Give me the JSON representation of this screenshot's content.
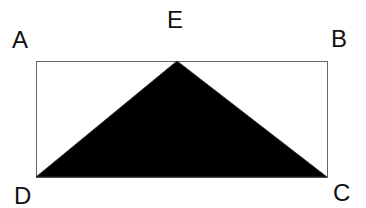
{
  "diagram": {
    "points": {
      "A": {
        "label": "A",
        "x": 36,
        "y": 61
      },
      "B": {
        "label": "B",
        "x": 327,
        "y": 61
      },
      "C": {
        "label": "C",
        "x": 327,
        "y": 177
      },
      "D": {
        "label": "D",
        "x": 36,
        "y": 177
      },
      "E": {
        "label": "E",
        "x": 177,
        "y": 61
      }
    },
    "shapes": [
      {
        "type": "rectangle",
        "vertices": [
          "A",
          "B",
          "C",
          "D"
        ],
        "fill": "#ffffff",
        "stroke": "#555555"
      },
      {
        "type": "triangle",
        "vertices": [
          "D",
          "E",
          "C"
        ],
        "fill": "#000000"
      }
    ]
  }
}
